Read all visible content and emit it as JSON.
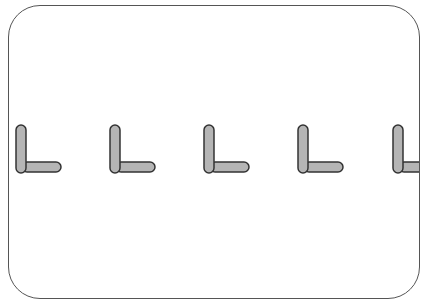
{
  "figure": {
    "frame": {
      "border_color": "#555555",
      "background": "#ffffff",
      "corner_radius": 32
    },
    "shape_style": {
      "fill": "#b5b5b5",
      "stroke": "#333333"
    },
    "shapes": [
      {
        "type": "L-shape",
        "x": 16,
        "clipped": false
      },
      {
        "type": "L-shape",
        "x": 110,
        "clipped": false
      },
      {
        "type": "L-shape",
        "x": 204,
        "clipped": false
      },
      {
        "type": "L-shape",
        "x": 298,
        "clipped": false
      },
      {
        "type": "L-shape",
        "x": 393,
        "clipped": true
      }
    ],
    "count": 5
  }
}
